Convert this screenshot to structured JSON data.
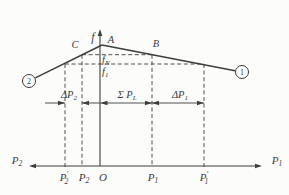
{
  "figure": {
    "title_semantic": "frequency-power characteristic of two interconnected systems",
    "colors": {
      "ink": "#3d3d3d",
      "paper": "#fcfcfa"
    },
    "canvas": {
      "width": 289,
      "height": 195
    },
    "v_axis": {
      "x": 100,
      "y_top": 29,
      "y_bottom": 166,
      "label": {
        "base": "f"
      },
      "label_x": 93,
      "label_y": 41
    },
    "h_axis": {
      "y": 166,
      "x_left": 29,
      "x_right": 262,
      "left_label": {
        "base": "P",
        "sub": "2"
      },
      "left_label_x": 17,
      "left_label_y": 164,
      "right_label": {
        "base": "P",
        "sub": "1"
      },
      "right_label_x": 277,
      "right_label_y": 164
    },
    "char_lines": [
      {
        "name": "system-2-characteristic-line",
        "x1": 35.3,
        "y1": 77.9,
        "x2": 102,
        "y2": 45
      },
      {
        "name": "system-1-characteristic-line",
        "x1": 102,
        "y1": 45,
        "x2": 235,
        "y2": 70.7
      }
    ],
    "nodes": [
      {
        "name": "system-2-node",
        "digit": "2",
        "cx": 29,
        "cy": 81,
        "r": 6.5
      },
      {
        "name": "system-1-node",
        "digit": "1",
        "cx": 242,
        "cy": 72,
        "r": 6.5
      }
    ],
    "point_labels": [
      {
        "name": "point-a-label",
        "text": {
          "base": "A"
        },
        "x": 111,
        "y": 43
      },
      {
        "name": "point-b-label",
        "text": {
          "base": "B"
        },
        "x": 156,
        "y": 47
      },
      {
        "name": "point-c-label",
        "text": {
          "base": "C"
        },
        "x": 75,
        "y": 48
      }
    ],
    "freq_guides": [
      {
        "name": "fn-level-guide",
        "y": 54.7,
        "x1": 82,
        "x2": 152,
        "label": {
          "base": "f",
          "sub": "N"
        },
        "label_x": 102,
        "label_y": 63
      },
      {
        "name": "f1-level-guide",
        "y": 64,
        "x1": 65,
        "x2": 204,
        "label": {
          "base": "f",
          "sub": "1"
        },
        "label_x": 102,
        "label_y": 74.5
      }
    ],
    "v_guides": [
      {
        "name": "p2-prime-guide",
        "x": 65,
        "y_top": 64
      },
      {
        "name": "p2-guide",
        "x": 82,
        "y_top": 54.7
      },
      {
        "name": "p1-guide",
        "x": 152,
        "y_top": 54.7
      },
      {
        "name": "p1-prime-guide",
        "x": 204,
        "y_top": 64
      }
    ],
    "dim_line": {
      "y": 103,
      "segments": [
        {
          "x1": 45,
          "x2": 65,
          "arrow_left": false,
          "arrow_right": true
        },
        {
          "x1": 82,
          "x2": 100,
          "arrow_left": true,
          "arrow_right": false
        },
        {
          "x1": 100.5,
          "x2": 152,
          "arrow_left": true,
          "arrow_right": true
        },
        {
          "x1": 152,
          "x2": 204,
          "arrow_left": true,
          "arrow_right": true
        }
      ],
      "labels": [
        {
          "name": "delta-p2-label",
          "text": {
            "base": "ΔP",
            "sub": "2"
          },
          "x": 69,
          "y": 98
        },
        {
          "name": "sigma-pl-label",
          "text": {
            "base": "Σ P",
            "sub": "L"
          },
          "x": 127,
          "y": 98
        },
        {
          "name": "delta-p1-label",
          "text": {
            "base": "ΔP",
            "sub": "1"
          },
          "x": 180,
          "y": 98
        }
      ]
    },
    "tick_labels": [
      {
        "name": "tick-p2-prime",
        "text": {
          "base": "P",
          "sub": "2",
          "prime": true
        },
        "x": 64,
        "y": 181
      },
      {
        "name": "tick-p2",
        "text": {
          "base": "P",
          "sub": "2"
        },
        "x": 84,
        "y": 181
      },
      {
        "name": "tick-origin",
        "text": {
          "base": "O"
        },
        "x": 103,
        "y": 181
      },
      {
        "name": "tick-p1",
        "text": {
          "base": "P",
          "sub": "1"
        },
        "x": 153,
        "y": 181
      },
      {
        "name": "tick-p1-prime",
        "text": {
          "base": "P",
          "sub": "1",
          "prime": true
        },
        "x": 204,
        "y": 181
      }
    ]
  }
}
